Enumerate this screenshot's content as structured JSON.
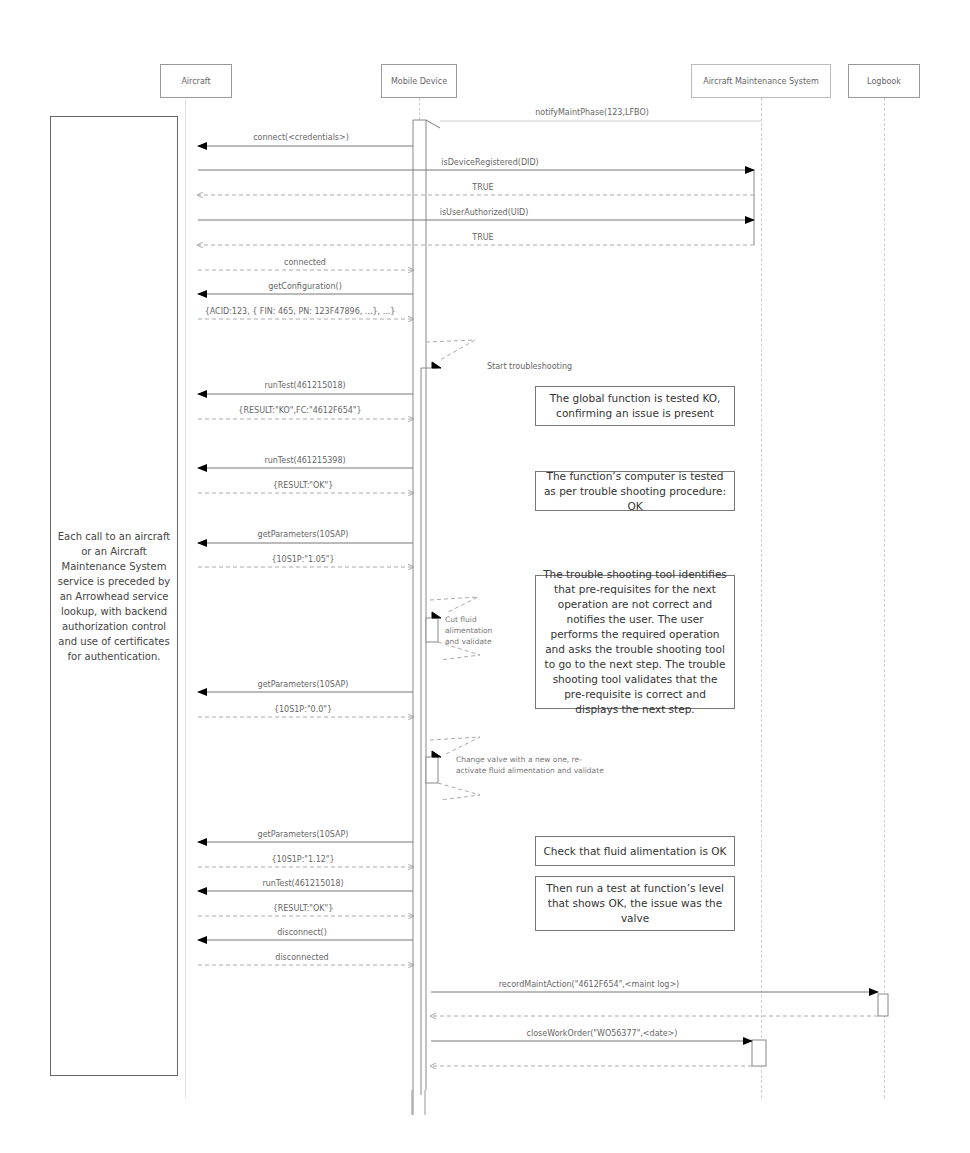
{
  "actors": [
    {
      "id": "aircraft",
      "label": "Aircraft"
    },
    {
      "id": "mobile",
      "label": "Mobile Device"
    },
    {
      "id": "ams",
      "label": "Aircraft Maintenance System"
    },
    {
      "id": "logbook",
      "label": "Logbook"
    }
  ],
  "side_note": "Each call to an aircraft or an Aircraft Maintenance System service is preceded by an Arrowhead service lookup, with backend authorization control and use of certificates for authentication.",
  "messages": [
    {
      "label": "notifyMaintPhase(123,LFBO)",
      "from": "ams",
      "to": "mobile",
      "type": "sync"
    },
    {
      "label": "connect(<credentials>)",
      "from": "mobile",
      "to": "aircraft",
      "type": "sync"
    },
    {
      "label": "isDeviceRegistered(DID)",
      "from": "aircraft",
      "to": "ams",
      "type": "sync"
    },
    {
      "label": "TRUE",
      "from": "ams",
      "to": "aircraft",
      "type": "return"
    },
    {
      "label": "isUserAuthorized(UID)",
      "from": "aircraft",
      "to": "ams",
      "type": "sync"
    },
    {
      "label": "TRUE",
      "from": "ams",
      "to": "aircraft",
      "type": "return"
    },
    {
      "label": "connected",
      "from": "aircraft",
      "to": "mobile",
      "type": "return"
    },
    {
      "label": "getConfiguration()",
      "from": "mobile",
      "to": "aircraft",
      "type": "sync"
    },
    {
      "label": "{ACID:123, { FIN: 465, PN: 123F47896, ...}, ...}",
      "from": "aircraft",
      "to": "mobile",
      "type": "return"
    },
    {
      "label": "Start troubleshooting",
      "from": "mobile",
      "to": "mobile",
      "type": "self"
    },
    {
      "label": "runTest(461215018)",
      "from": "mobile",
      "to": "aircraft",
      "type": "sync"
    },
    {
      "label": "{RESULT:\"KO\",FC:\"4612F654\"}",
      "from": "aircraft",
      "to": "mobile",
      "type": "return"
    },
    {
      "label": "runTest(461215398)",
      "from": "mobile",
      "to": "aircraft",
      "type": "sync"
    },
    {
      "label": "{RESULT:\"OK\"}",
      "from": "aircraft",
      "to": "mobile",
      "type": "return"
    },
    {
      "label": "getParameters(10SAP)",
      "from": "mobile",
      "to": "aircraft",
      "type": "sync"
    },
    {
      "label": "{10S1P:\"1.05\"}",
      "from": "aircraft",
      "to": "mobile",
      "type": "return"
    },
    {
      "label": "Cut fluid alimentation and validate",
      "from": "mobile",
      "to": "mobile",
      "type": "self"
    },
    {
      "label": "getParameters(10SAP)",
      "from": "mobile",
      "to": "aircraft",
      "type": "sync"
    },
    {
      "label": "{10S1P:\"0.0\"}",
      "from": "aircraft",
      "to": "mobile",
      "type": "return"
    },
    {
      "label": "Change valve with a new one, re-activate fluid alimentation and validate",
      "from": "mobile",
      "to": "mobile",
      "type": "self"
    },
    {
      "label": "getParameters(10SAP)",
      "from": "mobile",
      "to": "aircraft",
      "type": "sync"
    },
    {
      "label": "{10S1P:\"1.12\"}",
      "from": "aircraft",
      "to": "mobile",
      "type": "return"
    },
    {
      "label": "runTest(461215018)",
      "from": "mobile",
      "to": "aircraft",
      "type": "sync"
    },
    {
      "label": "{RESULT:\"OK\"}",
      "from": "aircraft",
      "to": "mobile",
      "type": "return"
    },
    {
      "label": "disconnect()",
      "from": "mobile",
      "to": "aircraft",
      "type": "sync"
    },
    {
      "label": "disconnected",
      "from": "aircraft",
      "to": "mobile",
      "type": "return"
    },
    {
      "label": "recordMaintAction(\"4612F654\",<maint log>)",
      "from": "mobile",
      "to": "logbook",
      "type": "sync"
    },
    {
      "label": "",
      "from": "logbook",
      "to": "mobile",
      "type": "return"
    },
    {
      "label": "closeWorkOrder(\"WO56377\",<date>)",
      "from": "mobile",
      "to": "ams",
      "type": "sync"
    },
    {
      "label": "",
      "from": "ams",
      "to": "mobile",
      "type": "return"
    }
  ],
  "notes": [
    {
      "text": "The global function is tested KO, confirming an issue is present"
    },
    {
      "text": "The function’s computer is tested as per trouble shooting procedure: OK"
    },
    {
      "text": "The trouble shooting tool identifies that pre-requisites for the next operation are not correct and notifies the user. The user performs the required operation and asks the trouble shooting tool to go to the next step. The trouble shooting tool validates that the pre-requisite is correct and displays the next step."
    },
    {
      "text": "Check that fluid alimentation is OK"
    },
    {
      "text": "Then run a test at function’s level that shows OK, the issue was the valve"
    }
  ],
  "colors": {
    "line": "#777777",
    "return_line": "#aaaaaa",
    "lifeline": "#cfcfcf",
    "arrowhead": "#000000"
  }
}
